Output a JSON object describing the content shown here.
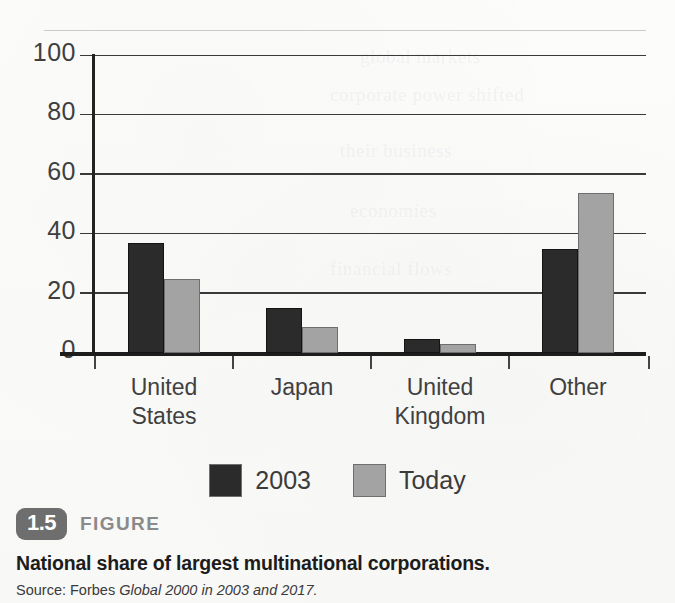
{
  "figure": {
    "badge": "1.5",
    "kicker": "FIGURE",
    "title": "National share of largest multinational corporations.",
    "source_prefix": "Source:",
    "source_publisher": "Forbes",
    "source_dataset": "Global 2000 in 2003 and 2017."
  },
  "colors": {
    "series_2003": "#2b2b2b",
    "series_today": "#a3a3a3",
    "axis": "#1d1d1d",
    "gridline": "#3a3a3a",
    "badge": "#6e6e6e",
    "paper": "#fbfbfa"
  },
  "chart_data": {
    "type": "bar",
    "title": "National share of largest multinational corporations.",
    "xlabel": "",
    "ylabel": "",
    "ylim": [
      0,
      100
    ],
    "yticks": [
      0,
      20,
      40,
      60,
      80,
      100
    ],
    "grid": true,
    "legend_position": "bottom",
    "categories": [
      "United States",
      "Japan",
      "United Kingdom",
      "Other"
    ],
    "category_lines": [
      [
        "United",
        "States"
      ],
      [
        "Japan"
      ],
      [
        "United",
        "Kingdom"
      ],
      [
        "Other"
      ]
    ],
    "series": [
      {
        "name": "2003",
        "color": "#2b2b2b",
        "values": [
          37,
          15,
          4.7,
          35
        ]
      },
      {
        "name": "Today",
        "color": "#a3a3a3",
        "values": [
          25,
          8.7,
          3,
          54
        ]
      }
    ]
  },
  "legend": [
    {
      "label": "2003",
      "color": "#2b2b2b"
    },
    {
      "label": "Today",
      "color": "#a3a3a3"
    }
  ],
  "bleed_text": [
    "global markets",
    "corporate power shifted",
    "their business",
    "economies",
    "financial flows"
  ]
}
